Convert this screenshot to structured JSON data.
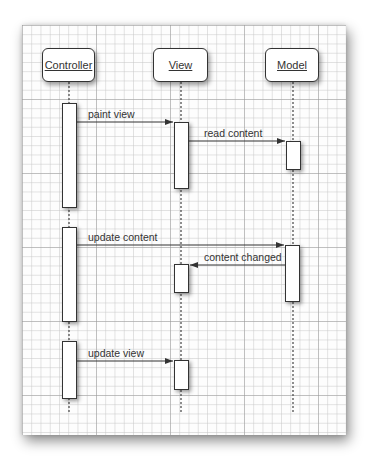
{
  "diagram": {
    "type": "sequence",
    "objects": [
      {
        "id": "controller",
        "label": "Controller",
        "x": 42,
        "width": 53,
        "center": 69
      },
      {
        "id": "view",
        "label": "View",
        "x": 153,
        "width": 55,
        "center": 181
      },
      {
        "id": "model",
        "label": "Model",
        "x": 265,
        "width": 54,
        "center": 293
      }
    ],
    "activations": [
      {
        "object": "controller",
        "top": 103,
        "bottom": 208
      },
      {
        "object": "controller",
        "top": 227,
        "bottom": 322
      },
      {
        "object": "controller",
        "top": 341,
        "bottom": 399
      },
      {
        "object": "view",
        "top": 122,
        "bottom": 189
      },
      {
        "object": "view",
        "top": 264,
        "bottom": 293
      },
      {
        "object": "view",
        "top": 360,
        "bottom": 390
      },
      {
        "object": "model",
        "top": 141,
        "bottom": 170
      },
      {
        "object": "model",
        "top": 245,
        "bottom": 302
      }
    ],
    "messages": [
      {
        "label": "paint view",
        "from": "controller",
        "to": "view",
        "y": 122
      },
      {
        "label": "read content",
        "from": "view",
        "to": "model",
        "y": 141
      },
      {
        "label": "update content",
        "from": "controller",
        "to": "model",
        "y": 245
      },
      {
        "label": "content changed",
        "from": "model",
        "to": "view",
        "y": 265
      },
      {
        "label": "update view",
        "from": "controller",
        "to": "view",
        "y": 361
      }
    ],
    "lifeline_end": 413
  }
}
